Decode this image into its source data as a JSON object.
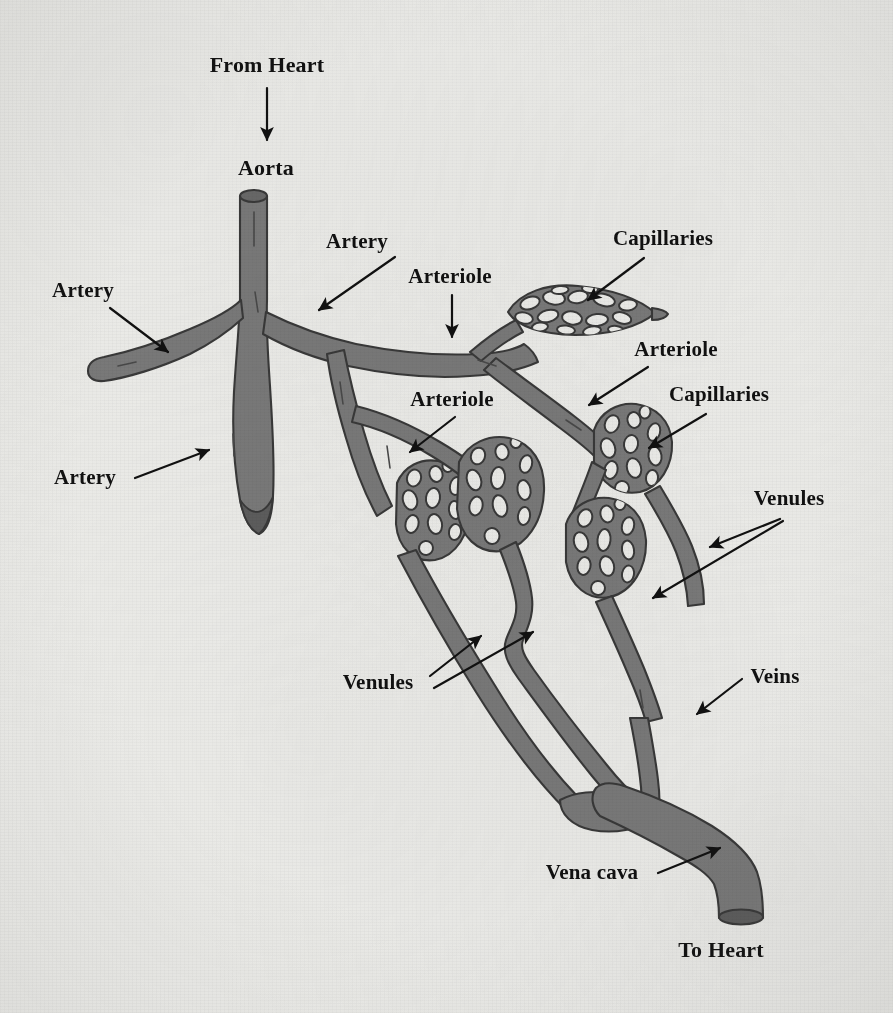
{
  "figure": {
    "background_color": "#efefec",
    "vessel_fill": "#7b7b7b",
    "vessel_stroke": "#3a3a3a",
    "label_color": "#111111"
  },
  "labels": [
    {
      "id": "from-heart",
      "text": "From Heart",
      "x": 267,
      "y": 72,
      "anchor": "middle"
    },
    {
      "id": "aorta",
      "text": "Aorta",
      "x": 266,
      "y": 175,
      "anchor": "middle"
    },
    {
      "id": "artery-top",
      "text": "Artery",
      "x": 357,
      "y": 248,
      "anchor": "middle"
    },
    {
      "id": "artery-left",
      "text": "Artery",
      "x": 83,
      "y": 297,
      "anchor": "middle"
    },
    {
      "id": "artery-low",
      "text": "Artery",
      "x": 85,
      "y": 484,
      "anchor": "middle"
    },
    {
      "id": "arteriole-top",
      "text": "Arteriole",
      "x": 450,
      "y": 283,
      "anchor": "middle"
    },
    {
      "id": "arteriole-mid",
      "text": "Arteriole",
      "x": 452,
      "y": 406,
      "anchor": "middle"
    },
    {
      "id": "arteriole-right",
      "text": "Arteriole",
      "x": 676,
      "y": 356,
      "anchor": "middle"
    },
    {
      "id": "capillaries-top",
      "text": "Capillaries",
      "x": 663,
      "y": 245,
      "anchor": "middle"
    },
    {
      "id": "capillaries-right",
      "text": "Capillaries",
      "x": 719,
      "y": 401,
      "anchor": "middle"
    },
    {
      "id": "venules-right",
      "text": "Venules",
      "x": 789,
      "y": 505,
      "anchor": "middle"
    },
    {
      "id": "venules-left",
      "text": "Venules",
      "x": 378,
      "y": 689,
      "anchor": "middle"
    },
    {
      "id": "veins",
      "text": "Veins",
      "x": 775,
      "y": 683,
      "anchor": "middle"
    },
    {
      "id": "vena-cava",
      "text": "Vena cava",
      "x": 592,
      "y": 879,
      "anchor": "middle"
    },
    {
      "id": "to-heart",
      "text": "To Heart",
      "x": 721,
      "y": 957,
      "anchor": "middle"
    }
  ],
  "arrows": [
    {
      "id": "arrow-from-heart",
      "points": "267,88 267,140"
    },
    {
      "id": "arrow-artery-top",
      "points": "395,257 319,310"
    },
    {
      "id": "arrow-artery-left",
      "points": "110,308 168,352"
    },
    {
      "id": "arrow-artery-low",
      "points": "135,478 209,450"
    },
    {
      "id": "arrow-arteriole-top",
      "points": "452,295 452,335"
    },
    {
      "id": "arrow-arteriole-mid",
      "points": "455,417 412,450"
    },
    {
      "id": "arrow-arteriole-right",
      "points": "648,367 591,404"
    },
    {
      "id": "arrow-capillaries-top",
      "points": "644,258 588,299"
    },
    {
      "id": "arrow-capillaries-right",
      "points": "706,414 651,447"
    },
    {
      "id": "arrow-venules-right-a",
      "points": "780,519 712,546"
    },
    {
      "id": "arrow-venules-right-b",
      "points": "783,521 655,597"
    },
    {
      "id": "arrow-venules-left-a",
      "points": "430,676 479,638"
    },
    {
      "id": "arrow-venules-left-b",
      "points": "434,688 531,633"
    },
    {
      "id": "arrow-veins",
      "points": "742,679 699,712"
    },
    {
      "id": "arrow-vena-cava",
      "points": "660,872 718,849"
    }
  ],
  "vessels": {
    "aorta_note": "vertical trunk descending from top opening, branching into arteries",
    "capillary_bed_count": 6,
    "openings": [
      "aorta-top-ellipse",
      "artery-stub-ellipse",
      "vena-cava-bottom-ellipse"
    ]
  }
}
